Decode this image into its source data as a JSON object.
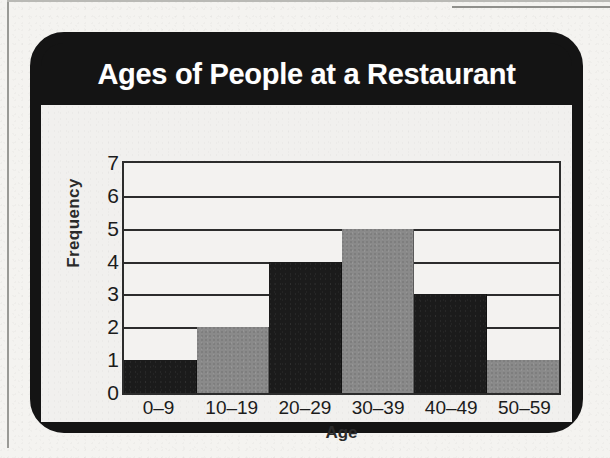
{
  "figure": {
    "title": "Ages of People at a Restaurant",
    "frame_color": "#141414",
    "panel_color": "#f1f0ee",
    "page_color": "#f4f3f0"
  },
  "chart_data": {
    "type": "bar",
    "title": "Ages of People at a Restaurant",
    "xlabel": "Age",
    "ylabel": "Frequency",
    "categories": [
      "0–9",
      "10–19",
      "20–29",
      "30–39",
      "40–49",
      "50–59"
    ],
    "values": [
      1,
      2,
      4,
      5,
      3,
      1
    ],
    "bar_colors": [
      "#1b1b1b",
      "#8a8a8a",
      "#1b1b1b",
      "#8a8a8a",
      "#1b1b1b",
      "#8a8a8a"
    ],
    "ylim": [
      0,
      7
    ],
    "ytick_labels": [
      "7",
      "6",
      "5",
      "4",
      "3",
      "2",
      "1",
      "0"
    ],
    "ytick_values": [
      7,
      6,
      5,
      4,
      3,
      2,
      1,
      0
    ],
    "grid": true,
    "grid_orientation": "horizontal",
    "legend": null,
    "bar_gap": 0,
    "axis_color": "#2c2c2c"
  }
}
